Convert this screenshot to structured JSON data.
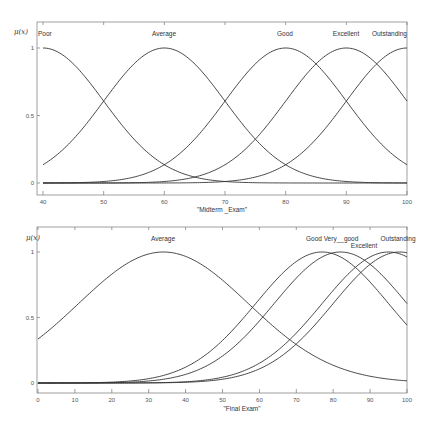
{
  "chart_data": [
    {
      "type": "line",
      "title": "",
      "xlabel": "\"Midterm _Exam\"",
      "ylabel": "μ(x)",
      "xlim": [
        40,
        100
      ],
      "ylim": [
        0,
        1
      ],
      "xticks": [
        "40",
        "50",
        "60",
        "70",
        "80",
        "90",
        "100"
      ],
      "yticks": [
        "0",
        "0.5",
        "1"
      ],
      "grid": false,
      "legend_position": "inline-labels-above-peaks",
      "series": [
        {
          "name": "Poor",
          "shape": "gaussian",
          "center": 40,
          "sigma": 10
        },
        {
          "name": "Average",
          "shape": "gaussian",
          "center": 60,
          "sigma": 10
        },
        {
          "name": "Good",
          "shape": "gaussian",
          "center": 80,
          "sigma": 10
        },
        {
          "name": "Excellent",
          "shape": "gaussian",
          "center": 90,
          "sigma": 10
        },
        {
          "name": "Outstanding",
          "shape": "gaussian",
          "center": 100,
          "sigma": 10
        }
      ]
    },
    {
      "type": "line",
      "title": "",
      "xlabel": "\"Final  Exam\"",
      "ylabel": "μ(x)",
      "xlim": [
        0,
        100
      ],
      "ylim": [
        0,
        1
      ],
      "xticks": [
        "0",
        "10",
        "20",
        "30",
        "40",
        "50",
        "60",
        "70",
        "80",
        "90",
        "100"
      ],
      "yticks": [
        "0",
        "0.5",
        "1"
      ],
      "grid": false,
      "legend_position": "inline-labels-above-peaks",
      "series": [
        {
          "name": "Average",
          "shape": "gaussian",
          "center": 34,
          "sigma": 23
        },
        {
          "name": "Good",
          "shape": "gaussian",
          "center": 77,
          "sigma": 18
        },
        {
          "name": "Very__good",
          "shape": "gaussian",
          "center": 82,
          "sigma": 18
        },
        {
          "name": "Excellent",
          "shape": "gaussian",
          "center": 95,
          "sigma": 18
        },
        {
          "name": "Outstanding",
          "shape": "gaussian",
          "center": 98,
          "sigma": 18
        }
      ]
    }
  ],
  "top": {
    "ylabel": "μ(x)",
    "xlabel": "\"Midterm _Exam\"",
    "labels": [
      "Poor",
      "Average",
      "Good",
      "Excellent",
      "Outstanding"
    ],
    "xticks": [
      "40",
      "50",
      "60",
      "70",
      "80",
      "90",
      "100"
    ],
    "yticks": [
      "0",
      "0.5",
      "1"
    ]
  },
  "bottom": {
    "ylabel": "μ(x)",
    "xlabel": "\"Final  Exam\"",
    "labels": [
      "Average",
      "Good",
      "Very__good",
      "Excellent",
      "Outstanding"
    ],
    "xticks": [
      "0",
      "10",
      "20",
      "30",
      "40",
      "50",
      "60",
      "70",
      "80",
      "90",
      "100"
    ],
    "yticks": [
      "0",
      "0.5",
      "1"
    ]
  },
  "colors": {
    "line": "#333333",
    "axis": "#777777"
  }
}
